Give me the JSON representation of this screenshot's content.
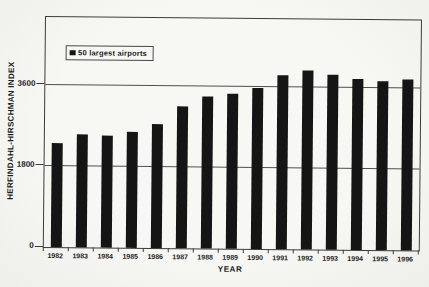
{
  "figure": {
    "background": "#f5f5f2"
  },
  "chart_data": {
    "type": "bar",
    "legend": "50 largest airports",
    "legend_position": "top-left",
    "xlabel": "YEAR",
    "ylabel": "HERFINDAHL-HIRSCHMAN INDEX",
    "categories": [
      "1982",
      "1983",
      "1984",
      "1985",
      "1986",
      "1987",
      "1988",
      "1989",
      "1990",
      "1991",
      "1992",
      "1993",
      "1994",
      "1995",
      "1996"
    ],
    "values": [
      2310,
      2500,
      2480,
      2570,
      2760,
      3160,
      3360,
      3440,
      3560,
      3860,
      3960,
      3880,
      3790,
      3750,
      3790
    ],
    "yticks": [
      0,
      1800,
      3600
    ],
    "ylim": [
      0,
      5100
    ],
    "grid": true,
    "bar_color": "#151515",
    "grid_color": "#4f4f4f",
    "frame_color": "#3c3c3c",
    "text_color": "#1c1c1c"
  }
}
